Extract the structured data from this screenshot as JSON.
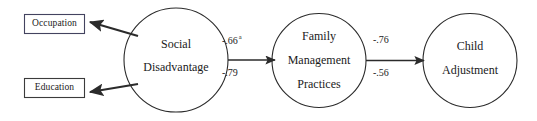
{
  "diagram": {
    "background_color": "#ffffff",
    "stroke_color": "#2b2b2b",
    "text_color": "#1a1a1a",
    "indicator_box_border_color": "#3b3b5c",
    "observed_variables": [
      {
        "label": "Occupation"
      },
      {
        "label": "Education"
      }
    ],
    "latent_variables": [
      {
        "lines": [
          "Social",
          "Disadvantage"
        ]
      },
      {
        "lines": [
          "Family",
          "Management",
          "Practices"
        ]
      },
      {
        "lines": [
          "Child",
          "Adjustment"
        ]
      }
    ],
    "paths": [
      {
        "from": "Social Disadvantage",
        "to": "Family Management Practices",
        "coefficients": [
          {
            "value": "-.66",
            "superscript": "a"
          },
          {
            "value": "-.79",
            "superscript": ""
          }
        ]
      },
      {
        "from": "Family Management Practices",
        "to": "Child Adjustment",
        "coefficients": [
          {
            "value": "-.76",
            "superscript": ""
          },
          {
            "value": "-.56",
            "superscript": ""
          }
        ]
      }
    ]
  }
}
